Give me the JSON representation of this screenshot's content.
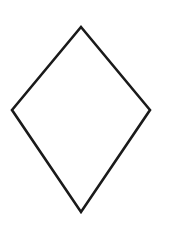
{
  "canvas": {
    "width": 169,
    "height": 227,
    "background_color": "#ffffff",
    "description": "line-drawing of a kite quadrilateral"
  },
  "shape": {
    "name": "kite",
    "label": "kite-quadrilateral",
    "fill_color": "#ffffff",
    "stroke_color": "#1a1a1a",
    "stroke_width": 2.6,
    "stroke_linejoin": "miter",
    "vertices": [
      {
        "name": "top-vertex",
        "x": 81,
        "y": 27
      },
      {
        "name": "right-vertex",
        "x": 150,
        "y": 110
      },
      {
        "name": "bottom-vertex",
        "x": 81,
        "y": 212
      },
      {
        "name": "left-vertex",
        "x": 12,
        "y": 110
      }
    ],
    "points_attr": "81,27 150,110 81,212 12,110",
    "geometry": {
      "horizontal_diagonal_length": 138,
      "vertical_diagonal_length": 185,
      "upper_height": 83,
      "lower_height": 102,
      "axis_of_symmetry": "vertical",
      "center_x": 81
    }
  }
}
